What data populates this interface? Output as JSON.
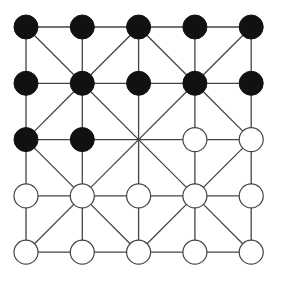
{
  "game": {
    "name": "Alquerque",
    "size": 5,
    "origin": [
      26,
      27
    ],
    "spacing": 56.3,
    "stone_radius": 12,
    "colors": {
      "black": "#111111",
      "white": "#ffffff",
      "line": "#444444"
    },
    "board": [
      [
        "B",
        "B",
        "B",
        "B",
        "B"
      ],
      [
        "B",
        "B",
        "B",
        "B",
        "B"
      ],
      [
        "B",
        "B",
        ".",
        "W",
        "W"
      ],
      [
        "W",
        "W",
        "W",
        "W",
        "W"
      ],
      [
        "W",
        "W",
        "W",
        "W",
        "W"
      ]
    ]
  }
}
